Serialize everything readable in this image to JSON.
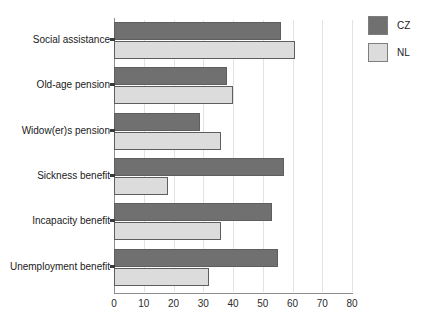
{
  "chart_data": {
    "type": "bar",
    "orientation": "horizontal",
    "title": "",
    "subtitle": "",
    "xlabel": "",
    "ylabel": "",
    "xlim": [
      0,
      80
    ],
    "xticks": [
      0,
      10,
      20,
      30,
      40,
      50,
      60,
      70,
      80
    ],
    "xtick_labels": [
      "0",
      "10",
      "20",
      "30",
      "40",
      "50",
      "60",
      "70",
      "80"
    ],
    "grid": true,
    "grid_axis": "x",
    "legend_position": "top-right",
    "categories": [
      "Social assistance",
      "Old-age pension",
      "Widow(er)s pension",
      "Sickness benefit",
      "Incapacity benefit",
      "Unemployment benefit"
    ],
    "series": [
      {
        "name": "CZ",
        "color": "#707070",
        "values": [
          56,
          38,
          29,
          57,
          53,
          55
        ]
      },
      {
        "name": "NL",
        "color": "#dcdcdc",
        "values": [
          61,
          40,
          36,
          18,
          36,
          32
        ]
      }
    ]
  },
  "legend": {
    "entries": [
      {
        "label": "CZ",
        "swatch": "legend-swatch-cz"
      },
      {
        "label": "NL",
        "swatch": "legend-swatch-nl"
      }
    ]
  }
}
